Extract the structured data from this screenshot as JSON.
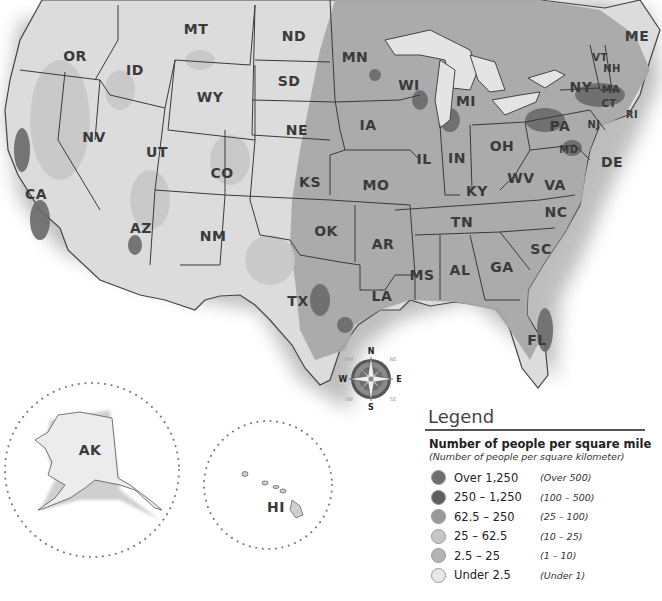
{
  "map": {
    "title": "Population Density of the United States",
    "states": [
      {
        "abbr": "MT",
        "x": 196,
        "y": 29
      },
      {
        "abbr": "ND",
        "x": 294,
        "y": 36
      },
      {
        "abbr": "MN",
        "x": 355,
        "y": 57
      },
      {
        "abbr": "OR",
        "x": 75,
        "y": 56
      },
      {
        "abbr": "ID",
        "x": 135,
        "y": 70
      },
      {
        "abbr": "SD",
        "x": 289,
        "y": 81
      },
      {
        "abbr": "WI",
        "x": 409,
        "y": 85
      },
      {
        "abbr": "MI",
        "x": 466,
        "y": 101
      },
      {
        "abbr": "WY",
        "x": 210,
        "y": 97
      },
      {
        "abbr": "NY",
        "x": 581,
        "y": 87
      },
      {
        "abbr": "ME",
        "x": 637,
        "y": 36
      },
      {
        "abbr": "VT",
        "x": 600,
        "y": 57
      },
      {
        "abbr": "NH",
        "x": 612,
        "y": 68
      },
      {
        "abbr": "MA",
        "x": 611,
        "y": 89
      },
      {
        "abbr": "CT",
        "x": 609,
        "y": 103
      },
      {
        "abbr": "RI",
        "x": 632,
        "y": 114
      },
      {
        "abbr": "NJ",
        "x": 594,
        "y": 124
      },
      {
        "abbr": "PA",
        "x": 560,
        "y": 126
      },
      {
        "abbr": "MD",
        "x": 569,
        "y": 149
      },
      {
        "abbr": "DE",
        "x": 612,
        "y": 162
      },
      {
        "abbr": "IA",
        "x": 368,
        "y": 125
      },
      {
        "abbr": "NE",
        "x": 297,
        "y": 130
      },
      {
        "abbr": "NV",
        "x": 94,
        "y": 137
      },
      {
        "abbr": "UT",
        "x": 157,
        "y": 152
      },
      {
        "abbr": "IL",
        "x": 424,
        "y": 159
      },
      {
        "abbr": "IN",
        "x": 457,
        "y": 158
      },
      {
        "abbr": "OH",
        "x": 502,
        "y": 146
      },
      {
        "abbr": "CO",
        "x": 222,
        "y": 173
      },
      {
        "abbr": "KS",
        "x": 310,
        "y": 182
      },
      {
        "abbr": "MO",
        "x": 376,
        "y": 185
      },
      {
        "abbr": "KY",
        "x": 477,
        "y": 191
      },
      {
        "abbr": "WV",
        "x": 521,
        "y": 178
      },
      {
        "abbr": "VA",
        "x": 555,
        "y": 185
      },
      {
        "abbr": "CA",
        "x": 36,
        "y": 194
      },
      {
        "abbr": "NC",
        "x": 556,
        "y": 212
      },
      {
        "abbr": "TN",
        "x": 462,
        "y": 222
      },
      {
        "abbr": "AZ",
        "x": 141,
        "y": 228
      },
      {
        "abbr": "NM",
        "x": 213,
        "y": 236
      },
      {
        "abbr": "OK",
        "x": 326,
        "y": 231
      },
      {
        "abbr": "AR",
        "x": 383,
        "y": 244
      },
      {
        "abbr": "SC",
        "x": 541,
        "y": 249
      },
      {
        "abbr": "MS",
        "x": 422,
        "y": 275
      },
      {
        "abbr": "AL",
        "x": 460,
        "y": 270
      },
      {
        "abbr": "GA",
        "x": 502,
        "y": 267
      },
      {
        "abbr": "TX",
        "x": 298,
        "y": 301
      },
      {
        "abbr": "LA",
        "x": 382,
        "y": 296
      },
      {
        "abbr": "FL",
        "x": 537,
        "y": 340
      },
      {
        "abbr": "AK",
        "x": 90,
        "y": 450
      },
      {
        "abbr": "HI",
        "x": 276,
        "y": 507
      }
    ]
  },
  "compass": {
    "n": "N",
    "s": "S",
    "e": "E",
    "w": "W",
    "ne": "NE",
    "nw": "NW",
    "se": "SE",
    "sw": "SW"
  },
  "legend": {
    "title": "Legend",
    "subtitle": "Number of people per square mile",
    "subtitle_metric": "(Number of people per square kilometer)",
    "items": [
      {
        "label": "Over 1,250",
        "metric": "(Over 500)",
        "color": "#6e6e6e"
      },
      {
        "label": "250 – 1,250",
        "metric": "(100 – 500)",
        "color": "#5e5e5e"
      },
      {
        "label": "62.5 – 250",
        "metric": "(25 – 100)",
        "color": "#9a9a9a"
      },
      {
        "label": "25 – 62.5",
        "metric": "(10 – 25)",
        "color": "#c6c6c6"
      },
      {
        "label": "2.5 – 25",
        "metric": "(1 – 10)",
        "color": "#b4b4b4"
      },
      {
        "label": "Under 2.5",
        "metric": "(Under 1)",
        "color": "#e8e8e8"
      }
    ]
  }
}
